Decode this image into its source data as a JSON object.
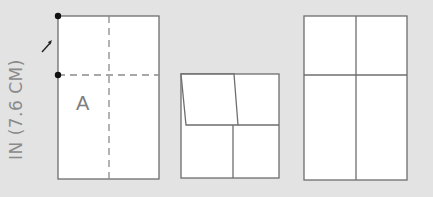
{
  "diagram": {
    "dimension_label": "3 IN (7.6 CM)",
    "dimension_label_visible": "IN (7.6 CM)",
    "panel1": {
      "label": "A",
      "fold_lines": "dashed",
      "markers": [
        "top-left dot",
        "mid-left dot"
      ]
    },
    "panel2": {
      "description": "top half folded down with slanted edges"
    },
    "panel3": {
      "description": "unfolded rectangle with cross creases"
    },
    "colors": {
      "background": "#e3e3e3",
      "paper": "#ffffff",
      "line": "#6e6e6e",
      "dash": "#8a8a8a",
      "marker": "#111111"
    }
  }
}
